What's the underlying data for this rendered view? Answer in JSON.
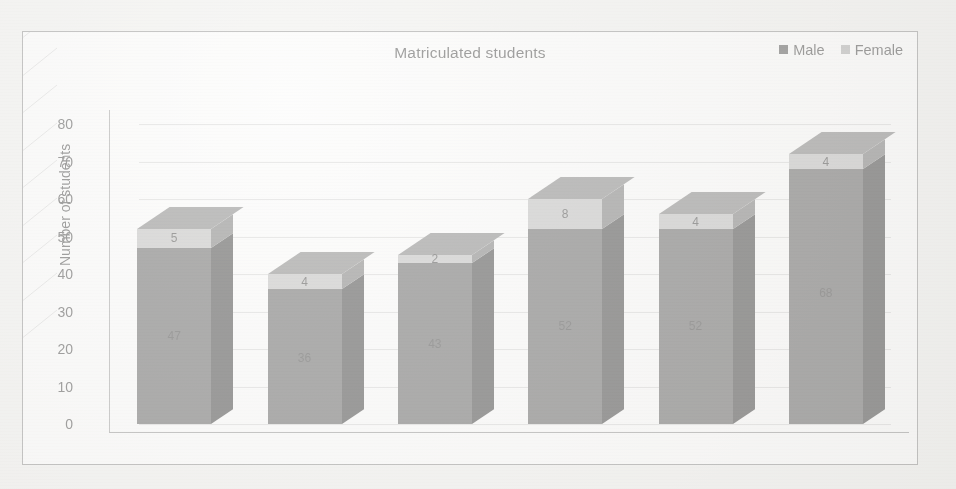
{
  "chart_data": {
    "type": "bar",
    "subtype": "3d-stacked-column",
    "title": "Matriculated students",
    "xlabel": "",
    "ylabel": "Number of students",
    "categories": [
      "2013/2014",
      "2014/2015",
      "2015/2016",
      "2016/2017",
      "2017/2018",
      "2018/2019"
    ],
    "series": [
      {
        "name": "Male",
        "values": [
          47,
          36,
          43,
          52,
          52,
          68
        ],
        "color": "#585858"
      },
      {
        "name": "Female",
        "values": [
          5,
          4,
          2,
          8,
          4,
          4
        ],
        "color": "#b9b9b9"
      }
    ],
    "totals": [
      52,
      40,
      45,
      60,
      56,
      72
    ],
    "ylim": [
      0,
      80
    ],
    "ytick_step": 10,
    "yticks": [
      "0",
      "10",
      "20",
      "30",
      "40",
      "50",
      "60",
      "70",
      "80"
    ],
    "grid": true,
    "legend_position": "top-right",
    "stacked": true
  },
  "legend": {
    "items": [
      {
        "label": "Male",
        "swatch": "legend-swatch-male",
        "color": "#4b4b4b"
      },
      {
        "label": "Female",
        "swatch": "legend-swatch-female",
        "color": "#a8a8a8"
      }
    ]
  },
  "colors": {
    "male_front": "#585858",
    "male_side": "#333333",
    "male_top": "#424242",
    "female_front": "#b9b9b9",
    "female_side": "#6f6f6f",
    "female_top": "#7b7b7b",
    "grid": "#d8d6d2",
    "axis": "#8e8e8e",
    "plot_background": "#fdfdfc",
    "page_background": "#f2f1ef"
  }
}
